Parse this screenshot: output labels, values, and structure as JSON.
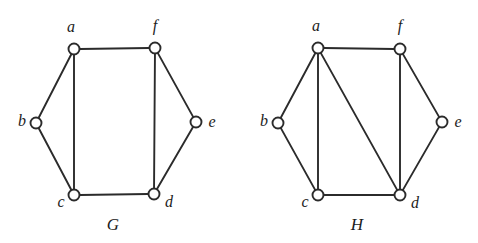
{
  "figure": {
    "background_color": "#ffffff",
    "ink_color": "#2b2b2b",
    "width": 478,
    "height": 243
  },
  "graphs": [
    {
      "id": "G",
      "caption": "G",
      "caption_pos": {
        "x": 113,
        "y": 226
      },
      "vertices": [
        {
          "id": "a",
          "label": "a",
          "x": 74,
          "y": 49,
          "r": 5.5,
          "label_x": 71,
          "label_y": 28,
          "label_anchor": "middle"
        },
        {
          "id": "b",
          "label": "b",
          "x": 36,
          "y": 123,
          "r": 5.5,
          "label_x": 22,
          "label_y": 122,
          "label_anchor": "middle"
        },
        {
          "id": "c",
          "label": "c",
          "x": 74,
          "y": 195,
          "r": 5.5,
          "label_x": 61,
          "label_y": 203,
          "label_anchor": "middle"
        },
        {
          "id": "d",
          "label": "d",
          "x": 154,
          "y": 194,
          "r": 5.5,
          "label_x": 169,
          "label_y": 203,
          "label_anchor": "middle"
        },
        {
          "id": "e",
          "label": "e",
          "x": 196,
          "y": 122,
          "r": 5.5,
          "label_x": 212,
          "label_y": 123,
          "label_anchor": "middle"
        },
        {
          "id": "f",
          "label": "f",
          "x": 155,
          "y": 48,
          "r": 5.5,
          "label_x": 155,
          "label_y": 27,
          "label_anchor": "middle"
        }
      ],
      "edges": [
        {
          "from": "a",
          "to": "f"
        },
        {
          "from": "a",
          "to": "b"
        },
        {
          "from": "a",
          "to": "c"
        },
        {
          "from": "b",
          "to": "c"
        },
        {
          "from": "c",
          "to": "d"
        },
        {
          "from": "d",
          "to": "e"
        },
        {
          "from": "d",
          "to": "f"
        },
        {
          "from": "e",
          "to": "f"
        }
      ]
    },
    {
      "id": "H",
      "caption": "H",
      "caption_pos": {
        "x": 357,
        "y": 226
      },
      "vertices": [
        {
          "id": "a",
          "label": "a",
          "x": 318,
          "y": 48,
          "r": 5.5,
          "label_x": 316,
          "label_y": 27,
          "label_anchor": "middle"
        },
        {
          "id": "b",
          "label": "b",
          "x": 278,
          "y": 123,
          "r": 5.5,
          "label_x": 264,
          "label_y": 122,
          "label_anchor": "middle"
        },
        {
          "id": "c",
          "label": "c",
          "x": 318,
          "y": 195,
          "r": 5.5,
          "label_x": 305,
          "label_y": 203,
          "label_anchor": "middle"
        },
        {
          "id": "d",
          "label": "d",
          "x": 400,
          "y": 195,
          "r": 5.5,
          "label_x": 415,
          "label_y": 204,
          "label_anchor": "middle"
        },
        {
          "id": "e",
          "label": "e",
          "x": 442,
          "y": 122,
          "r": 5.5,
          "label_x": 458,
          "label_y": 123,
          "label_anchor": "middle"
        },
        {
          "id": "f",
          "label": "f",
          "x": 400,
          "y": 49,
          "r": 5.5,
          "label_x": 400,
          "label_y": 27,
          "label_anchor": "middle"
        }
      ],
      "edges": [
        {
          "from": "a",
          "to": "f"
        },
        {
          "from": "a",
          "to": "b"
        },
        {
          "from": "a",
          "to": "c"
        },
        {
          "from": "a",
          "to": "d"
        },
        {
          "from": "b",
          "to": "c"
        },
        {
          "from": "c",
          "to": "d"
        },
        {
          "from": "d",
          "to": "e"
        },
        {
          "from": "d",
          "to": "f"
        },
        {
          "from": "e",
          "to": "f"
        }
      ]
    }
  ]
}
